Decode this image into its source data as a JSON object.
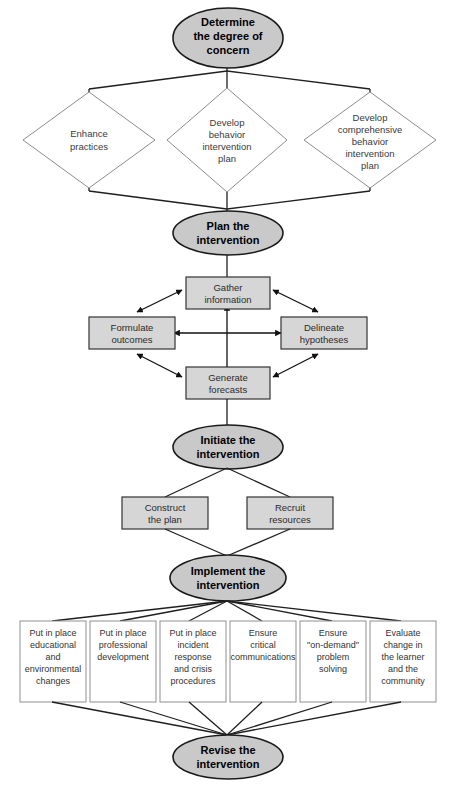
{
  "diagram": {
    "type": "flowchart",
    "colors": {
      "oval_fill": "#c9c9c9",
      "oval_stroke": "#1a1a1a",
      "gray_box_fill": "#d6d6d6",
      "gray_box_stroke": "#333333",
      "diamond_fill": "#ffffff",
      "diamond_stroke": "#8c8c8c",
      "white_box_fill": "#ffffff",
      "white_box_stroke": "#8f8f8f",
      "connector": "#1f1f1f",
      "background": "#ffffff"
    },
    "stages": [
      {
        "id": "determine",
        "label": "Determine the degree of concern",
        "lines": [
          "Determine",
          "the degree of",
          "concern"
        ],
        "shape": "oval"
      },
      {
        "id": "plan",
        "label": "Plan the intervention",
        "lines": [
          "Plan the",
          "intervention"
        ],
        "shape": "oval"
      },
      {
        "id": "initiate",
        "label": "Initiate the intervention",
        "lines": [
          "Initiate the",
          "intervention"
        ],
        "shape": "oval"
      },
      {
        "id": "implement",
        "label": "Implement the intervention",
        "lines": [
          "Implement the",
          "intervention"
        ],
        "shape": "oval"
      },
      {
        "id": "revise",
        "label": "Revise the intervention",
        "lines": [
          "Revise the",
          "intervention"
        ],
        "shape": "oval"
      }
    ],
    "decision_diamonds": [
      {
        "id": "enhance-practices",
        "label": "Enhance practices",
        "lines": [
          "Enhance",
          "practices"
        ]
      },
      {
        "id": "develop-behavior-intervention-plan",
        "label": "Develop behavior intervention plan",
        "lines": [
          "Develop",
          "behavior",
          "intervention",
          "plan"
        ]
      },
      {
        "id": "develop-comprehensive-behavior-intervention-plan",
        "label": "Develop comprehensive behavior intervention plan",
        "lines": [
          "Develop",
          "comprehensive",
          "behavior",
          "intervention",
          "plan"
        ]
      }
    ],
    "planning_cluster": {
      "top": {
        "id": "gather-information",
        "label": "Gather information",
        "lines": [
          "Gather",
          "information"
        ]
      },
      "left": {
        "id": "formulate-outcomes",
        "label": "Formulate outcomes",
        "lines": [
          "Formulate",
          "outcomes"
        ]
      },
      "right": {
        "id": "delineate-hypotheses",
        "label": "Delineate hypotheses",
        "lines": [
          "Delineate",
          "hypotheses"
        ]
      },
      "bottom": {
        "id": "generate-forecasts",
        "label": "Generate forecasts",
        "lines": [
          "Generate",
          "forecasts"
        ]
      },
      "arrow_style": "bidirectional"
    },
    "initiate_boxes": [
      {
        "id": "construct-the-plan",
        "label": "Construct the plan",
        "lines": [
          "Construct",
          "the plan"
        ]
      },
      {
        "id": "recruit-resources",
        "label": "Recruit resources",
        "lines": [
          "Recruit",
          "resources"
        ]
      }
    ],
    "implementation_boxes": [
      {
        "id": "put-in-place-educational-and-environmental-changes",
        "label": "Put in place educational and environmental changes",
        "lines": [
          "Put in place",
          "educational",
          "and",
          "environmental",
          "changes"
        ]
      },
      {
        "id": "put-in-place-professional-development",
        "label": "Put in place professional development",
        "lines": [
          "Put in place",
          "professional",
          "development"
        ]
      },
      {
        "id": "put-in-place-incident-response-and-crisis-procedures",
        "label": "Put in place incident response and crisis procedures",
        "lines": [
          "Put in place",
          "incident",
          "response",
          "and crisis",
          "procedures"
        ]
      },
      {
        "id": "ensure-critical-communications",
        "label": "Ensure critical communications",
        "lines": [
          "Ensure",
          "critical",
          "communications"
        ]
      },
      {
        "id": "ensure-on-demand-problem-solving",
        "label": "Ensure \"on-demand\" problem solving",
        "lines": [
          "Ensure",
          "\"on-demand\"",
          "problem",
          "solving"
        ]
      },
      {
        "id": "evaluate-change-in-the-learner-and-the-community",
        "label": "Evaluate change in the learner and the community",
        "lines": [
          "Evaluate",
          "change in",
          "the learner",
          "and the",
          "community"
        ]
      }
    ],
    "footer": {
      "clipped_caption": ""
    }
  }
}
